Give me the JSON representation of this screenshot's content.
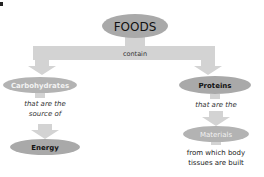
{
  "corner_mark": "▪",
  "colors": {
    "node_fill": "#a9a9a9",
    "node_fill_light": "#b8b8b8",
    "arrow_fill": "#d3d3d3",
    "text_dark": "#111111",
    "text_light": "#f2f2f2",
    "connector_text": "#333333"
  },
  "root": {
    "label": "FOODS"
  },
  "root_connector": {
    "label": "contain"
  },
  "branches": [
    {
      "node": {
        "label": "Carbohydrates",
        "text_style": "light"
      },
      "connector_lines": [
        "that are the",
        "source of"
      ],
      "child": {
        "label": "Energy",
        "text_style": "dark"
      }
    },
    {
      "node": {
        "label": "Proteins",
        "text_style": "dark"
      },
      "connector_lines": [
        "that are the"
      ],
      "child": {
        "label": "Materials",
        "text_style": "light"
      },
      "child_caption_lines": [
        "from which body",
        "tissues are built"
      ]
    }
  ]
}
